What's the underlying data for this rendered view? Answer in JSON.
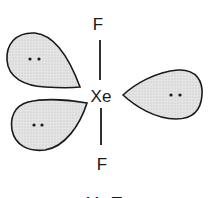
{
  "diagram": {
    "central_atom": "Xe",
    "bonded_atoms": [
      {
        "label": "F",
        "position": "top"
      },
      {
        "label": "F",
        "position": "bottom"
      }
    ],
    "lone_pairs": [
      {
        "position": "upper-left",
        "symbol": "••"
      },
      {
        "position": "lower-left",
        "symbol": "••"
      },
      {
        "position": "right",
        "symbol": "••"
      }
    ],
    "caption": "XeF₂",
    "colors": {
      "outline": "#1a1a1a",
      "lobe_fill": "#dcdcdc",
      "background": "#ffffff"
    }
  }
}
